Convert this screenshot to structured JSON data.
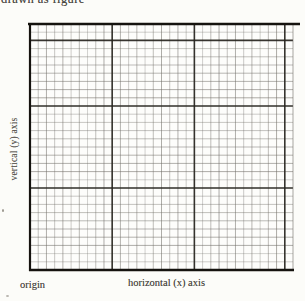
{
  "caption": {
    "clipped_text": "drawn as figure"
  },
  "figure": {
    "y_axis_label": "vertical (y) axis",
    "x_axis_label": "horizontal (x) axis",
    "origin_label": "origin"
  },
  "grid": {
    "left": 30,
    "top": 24,
    "right": 293,
    "bottom": 270,
    "cols": 32,
    "rows": 30,
    "major_cols": [
      10,
      20,
      31
    ],
    "major_rows": [
      2,
      10,
      20
    ],
    "colors": {
      "minor": "#6f6c66",
      "major": "#26231e",
      "border": "#15130f",
      "paper": "#fdfdfb"
    }
  }
}
